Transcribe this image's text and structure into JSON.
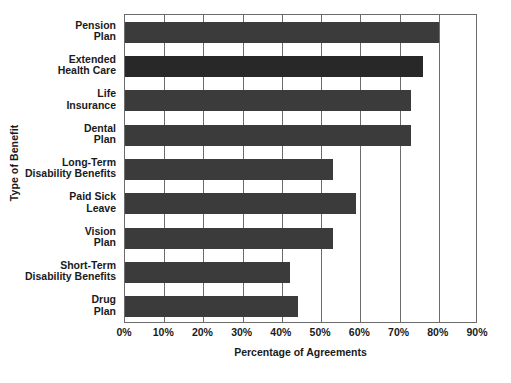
{
  "chart_data": {
    "type": "bar",
    "orientation": "horizontal",
    "title": "",
    "xlabel": "Percentage of Agreements",
    "ylabel": "Type of Benefit",
    "categories": [
      "Pension Plan",
      "Extended Health Care",
      "Life Insurance",
      "Dental Plan",
      "Long-Term Disability Benefits",
      "Paid Sick Leave",
      "Vision Plan",
      "Short-Term Disability Benefits",
      "Drug Plan"
    ],
    "values": [
      80,
      76,
      73,
      73,
      53,
      59,
      53,
      42,
      44
    ],
    "xlim": [
      0,
      90
    ],
    "xticks": [
      0,
      10,
      20,
      30,
      40,
      50,
      60,
      70,
      80,
      90
    ],
    "xtick_labels": [
      "0%",
      "10%",
      "20%",
      "30%",
      "40%",
      "50%",
      "60%",
      "70%",
      "80%",
      "90%"
    ],
    "grid": true,
    "grid_axis": "x",
    "legend": false,
    "bar_color": "#3b3b3b",
    "bar_color_alt": "#282828",
    "axis_color": "#6b6b6b"
  },
  "axes": {
    "y_title": "Type of Benefit",
    "x_title": "Percentage of Agreements"
  },
  "categories": [
    {
      "line1": "Pension",
      "line2": "Plan"
    },
    {
      "line1": "Extended",
      "line2": "Health Care"
    },
    {
      "line1": "Life",
      "line2": "Insurance"
    },
    {
      "line1": "Dental",
      "line2": "Plan"
    },
    {
      "line1": "Long-Term",
      "line2": "Disability Benefits"
    },
    {
      "line1": "Paid Sick",
      "line2": "Leave"
    },
    {
      "line1": "Vision",
      "line2": "Plan"
    },
    {
      "line1": "Short-Term",
      "line2": "Disability Benefits"
    },
    {
      "line1": "Drug",
      "line2": "Plan"
    }
  ],
  "xticks": [
    {
      "label": "0%"
    },
    {
      "label": "10%"
    },
    {
      "label": "20%"
    },
    {
      "label": "30%"
    },
    {
      "label": "40%"
    },
    {
      "label": "50%"
    },
    {
      "label": "60%"
    },
    {
      "label": "70%"
    },
    {
      "label": "80%"
    },
    {
      "label": "90%"
    }
  ]
}
